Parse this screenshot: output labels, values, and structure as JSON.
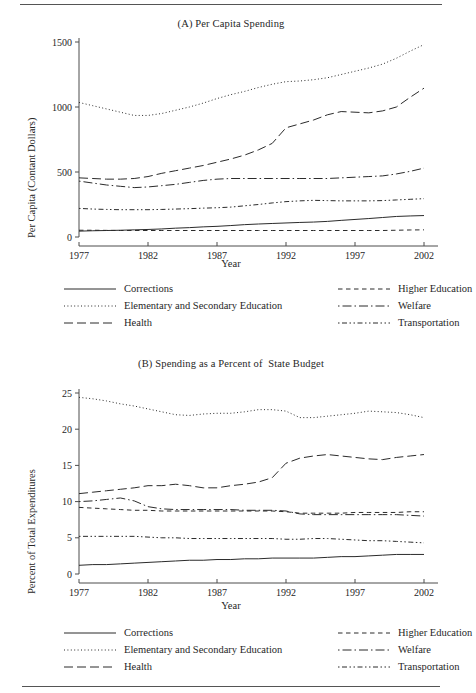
{
  "figure": {
    "xlabel": "Year",
    "legend_labels": {
      "corrections": "Corrections",
      "elementary": "Elementary and Secondary Education",
      "health": "Health",
      "higher_education": "Higher Education",
      "welfare": "Welfare",
      "transportation": "Transportation"
    }
  },
  "chart_data": [
    {
      "type": "line",
      "panel": "A",
      "title": "(A) Per Capita Spending",
      "xlabel": "Year",
      "ylabel": "Per Capita (Contant Dollars)",
      "xlim": [
        1977,
        2002
      ],
      "ylim": [
        0,
        1500
      ],
      "xticks": [
        1977,
        1982,
        1987,
        1992,
        1997,
        2002
      ],
      "yticks": [
        0,
        500,
        1000,
        1500
      ],
      "grid": false,
      "legend_position": "below",
      "x": [
        1977,
        1978,
        1979,
        1980,
        1981,
        1982,
        1983,
        1984,
        1985,
        1986,
        1987,
        1988,
        1989,
        1990,
        1991,
        1992,
        1993,
        1994,
        1995,
        1996,
        1997,
        1998,
        1999,
        2000,
        2001,
        2002
      ],
      "series": [
        {
          "name": "Elementary and Secondary Education",
          "linestyle": "dotted",
          "values": [
            1035,
            1010,
            985,
            960,
            935,
            935,
            950,
            975,
            1000,
            1030,
            1065,
            1095,
            1120,
            1150,
            1175,
            1195,
            1200,
            1210,
            1225,
            1250,
            1275,
            1300,
            1330,
            1375,
            1430,
            1480
          ]
        },
        {
          "name": "Health",
          "linestyle": "dashed",
          "values": [
            455,
            450,
            445,
            445,
            450,
            465,
            490,
            510,
            530,
            550,
            575,
            600,
            630,
            670,
            720,
            840,
            870,
            900,
            940,
            965,
            960,
            955,
            970,
            1000,
            1075,
            1145
          ]
        },
        {
          "name": "Welfare",
          "linestyle": "dashdot",
          "values": [
            430,
            415,
            400,
            390,
            380,
            385,
            395,
            405,
            420,
            435,
            445,
            450,
            450,
            450,
            450,
            450,
            450,
            450,
            450,
            455,
            460,
            465,
            470,
            485,
            505,
            530
          ]
        },
        {
          "name": "Transportation",
          "linestyle": "dashdotdot",
          "values": [
            220,
            215,
            212,
            210,
            210,
            210,
            212,
            215,
            218,
            222,
            225,
            230,
            240,
            250,
            262,
            272,
            278,
            282,
            280,
            278,
            278,
            278,
            280,
            285,
            290,
            295
          ]
        },
        {
          "name": "Corrections",
          "linestyle": "solid",
          "values": [
            45,
            48,
            50,
            52,
            55,
            58,
            62,
            68,
            72,
            78,
            82,
            88,
            95,
            100,
            104,
            108,
            112,
            115,
            120,
            128,
            135,
            142,
            150,
            158,
            162,
            165
          ]
        },
        {
          "name": "Higher Education",
          "linestyle": "dashed-short",
          "values": [
            52,
            52,
            51,
            50,
            50,
            50,
            50,
            50,
            50,
            50,
            50,
            50,
            50,
            50,
            50,
            50,
            50,
            50,
            50,
            50,
            50,
            50,
            50,
            52,
            54,
            55
          ]
        }
      ]
    },
    {
      "type": "line",
      "panel": "B",
      "title": "(B) Spending as a Percent of  State Budget",
      "xlabel": "Year",
      "ylabel": "Percent of Total Expenditures",
      "xlim": [
        1977,
        2002
      ],
      "ylim": [
        0,
        25
      ],
      "xticks": [
        1977,
        1982,
        1987,
        1992,
        1997,
        2002
      ],
      "yticks": [
        0,
        5,
        10,
        15,
        20,
        25
      ],
      "grid": false,
      "legend_position": "below",
      "x": [
        1977,
        1978,
        1979,
        1980,
        1981,
        1982,
        1983,
        1984,
        1985,
        1986,
        1987,
        1988,
        1989,
        1990,
        1991,
        1992,
        1993,
        1994,
        1995,
        1996,
        1997,
        1998,
        1999,
        2000,
        2001,
        2002
      ],
      "series": [
        {
          "name": "Elementary and Secondary Education",
          "linestyle": "dotted",
          "values": [
            24.4,
            24.2,
            23.9,
            23.5,
            23.2,
            22.8,
            22.4,
            22.0,
            21.9,
            22.1,
            22.2,
            22.2,
            22.4,
            22.7,
            22.7,
            22.5,
            21.6,
            21.6,
            21.8,
            22.0,
            22.2,
            22.5,
            22.4,
            22.3,
            22.0,
            21.6
          ]
        },
        {
          "name": "Health",
          "linestyle": "dashed",
          "values": [
            11.1,
            11.3,
            11.5,
            11.7,
            11.9,
            12.2,
            12.2,
            12.4,
            12.2,
            11.9,
            11.9,
            12.2,
            12.4,
            12.7,
            13.3,
            15.3,
            16.0,
            16.3,
            16.5,
            16.3,
            16.1,
            15.9,
            15.8,
            16.1,
            16.3,
            16.5
          ]
        },
        {
          "name": "Welfare",
          "linestyle": "dashdot",
          "values": [
            10.0,
            10.1,
            10.3,
            10.5,
            10.1,
            9.3,
            9.0,
            8.9,
            8.9,
            8.9,
            8.9,
            8.9,
            8.8,
            8.8,
            8.8,
            8.7,
            8.3,
            8.2,
            8.2,
            8.2,
            8.2,
            8.2,
            8.2,
            8.2,
            8.1,
            8.0
          ]
        },
        {
          "name": "Higher Education",
          "linestyle": "dashed-short",
          "values": [
            9.2,
            9.1,
            9.0,
            8.9,
            8.8,
            8.8,
            8.7,
            8.7,
            8.7,
            8.7,
            8.7,
            8.7,
            8.7,
            8.7,
            8.7,
            8.6,
            8.4,
            8.4,
            8.4,
            8.4,
            8.5,
            8.5,
            8.5,
            8.5,
            8.6,
            8.6
          ]
        },
        {
          "name": "Transportation",
          "linestyle": "dashdotdot",
          "values": [
            5.2,
            5.2,
            5.2,
            5.2,
            5.2,
            5.1,
            5.0,
            5.0,
            4.9,
            4.9,
            4.9,
            4.9,
            4.9,
            4.9,
            4.9,
            4.8,
            4.8,
            4.9,
            4.9,
            4.8,
            4.7,
            4.6,
            4.6,
            4.5,
            4.4,
            4.3
          ]
        },
        {
          "name": "Corrections",
          "linestyle": "solid",
          "values": [
            1.2,
            1.3,
            1.3,
            1.4,
            1.5,
            1.6,
            1.7,
            1.8,
            1.9,
            1.9,
            2.0,
            2.0,
            2.1,
            2.1,
            2.2,
            2.2,
            2.2,
            2.2,
            2.3,
            2.4,
            2.4,
            2.5,
            2.6,
            2.7,
            2.7,
            2.7
          ]
        }
      ]
    }
  ]
}
